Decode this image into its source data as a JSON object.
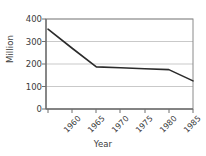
{
  "chart_data": {
    "type": "line",
    "title": "",
    "xlabel": "Year",
    "ylabel": "Million",
    "x": [
      1960,
      1965,
      1970,
      1975,
      1980,
      1985,
      1990
    ],
    "values": [
      355,
      270,
      187,
      183,
      179,
      175,
      125
    ],
    "series": [
      {
        "name": "",
        "values": [
          355,
          270,
          187,
          183,
          179,
          175,
          125
        ]
      }
    ],
    "categories": [
      "1960",
      "1965",
      "1970",
      "1975",
      "1980",
      "1985",
      "1990"
    ],
    "xtick_labels": [
      "1960",
      "1965",
      "1970",
      "1975",
      "1980",
      "1985",
      "1990"
    ],
    "ytick_labels": [
      "0",
      "100",
      "200",
      "300",
      "400"
    ],
    "ytick_values": [
      0,
      100,
      200,
      300,
      400
    ],
    "ylim": [
      0,
      400
    ],
    "xlim": [
      1960,
      1990
    ],
    "grid": true,
    "grid_axis": "y",
    "legend": false,
    "legend_position": "none",
    "line_color": "#2b2b2b",
    "grid_color": "#c9c9c9",
    "axis_color": "#6e6e6e",
    "text_color": "#3b3b3b",
    "background": "#ffffff"
  }
}
